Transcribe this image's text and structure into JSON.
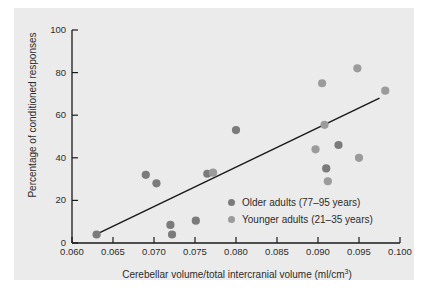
{
  "chart_data": {
    "type": "scatter",
    "title": "",
    "xlabel": "Cerebellar volume/total intercranial volume (ml/cm³)",
    "ylabel": "Percentage of conditioned responses",
    "xlim": [
      0.06,
      0.1
    ],
    "ylim": [
      0,
      100
    ],
    "xticks": [
      "0.060",
      "0.065",
      "0.070",
      "0.075",
      "0.080",
      "0.085",
      "0.090",
      "0.095",
      "0.100"
    ],
    "xtick_values": [
      0.06,
      0.065,
      0.07,
      0.075,
      0.08,
      0.085,
      0.09,
      0.095,
      0.1
    ],
    "yticks": [
      "0",
      "20",
      "40",
      "60",
      "80",
      "100"
    ],
    "ytick_values": [
      0,
      20,
      40,
      60,
      80,
      100
    ],
    "grid": false,
    "legend_position": "inside-lower-right",
    "series": [
      {
        "name": "Older adults (77–95 years)",
        "color": "#7b7b7b",
        "marker": "circle",
        "points": [
          {
            "x": 0.063,
            "y": 4
          },
          {
            "x": 0.069,
            "y": 32
          },
          {
            "x": 0.0703,
            "y": 28
          },
          {
            "x": 0.072,
            "y": 8.5
          },
          {
            "x": 0.0722,
            "y": 4
          },
          {
            "x": 0.0751,
            "y": 10.5
          },
          {
            "x": 0.0765,
            "y": 32.5
          },
          {
            "x": 0.08,
            "y": 53
          },
          {
            "x": 0.091,
            "y": 35
          },
          {
            "x": 0.0925,
            "y": 46
          }
        ]
      },
      {
        "name": "Younger adults (21–35 years)",
        "color": "#9b9b9b",
        "marker": "circle",
        "points": [
          {
            "x": 0.0772,
            "y": 33
          },
          {
            "x": 0.0897,
            "y": 44
          },
          {
            "x": 0.0905,
            "y": 75
          },
          {
            "x": 0.0908,
            "y": 55.5
          },
          {
            "x": 0.0912,
            "y": 29
          },
          {
            "x": 0.0948,
            "y": 82
          },
          {
            "x": 0.095,
            "y": 40
          },
          {
            "x": 0.0982,
            "y": 71.5
          }
        ]
      }
    ],
    "trendline": {
      "name": "regression-line",
      "color": "#1a1a1a",
      "x0": 0.0632,
      "y0": 4.5,
      "x1": 0.0975,
      "y1": 68
    },
    "colors": {
      "panel_background": "#ebebeb",
      "figure_background": "#ffffff",
      "axis": "#1a1a1a",
      "text": "#2b2b2b",
      "older_marker": "#7b7b7b",
      "younger_marker": "#9b9b9b",
      "trendline": "#1a1a1a"
    }
  },
  "legend": {
    "items": [
      {
        "label": "Older adults (77–95 years)",
        "color": "#7b7b7b"
      },
      {
        "label": "Younger adults (21–35 years)",
        "color": "#9b9b9b"
      }
    ]
  },
  "axes": {
    "x_title_main": "Cerebellar volume/total intercranial volume (ml/cm",
    "x_title_sup": "3",
    "x_title_tail": ")",
    "y_title": "Percentage of conditioned responses"
  }
}
